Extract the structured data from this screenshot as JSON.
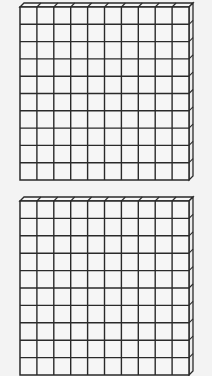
{
  "diagram": {
    "type": "base-ten-blocks",
    "background": "#f3f3f3",
    "line_color": "#2a2a2a",
    "face_color": "#f6f6f6",
    "flats": [
      {
        "label": "hundred-flat-1",
        "rows": 10,
        "cols": 10,
        "x": 20,
        "y": 7,
        "width": 169,
        "height": 173,
        "depth": 4
      },
      {
        "label": "hundred-flat-2",
        "rows": 10,
        "cols": 10,
        "x": 20,
        "y": 201,
        "width": 169,
        "height": 174,
        "depth": 4
      }
    ]
  }
}
